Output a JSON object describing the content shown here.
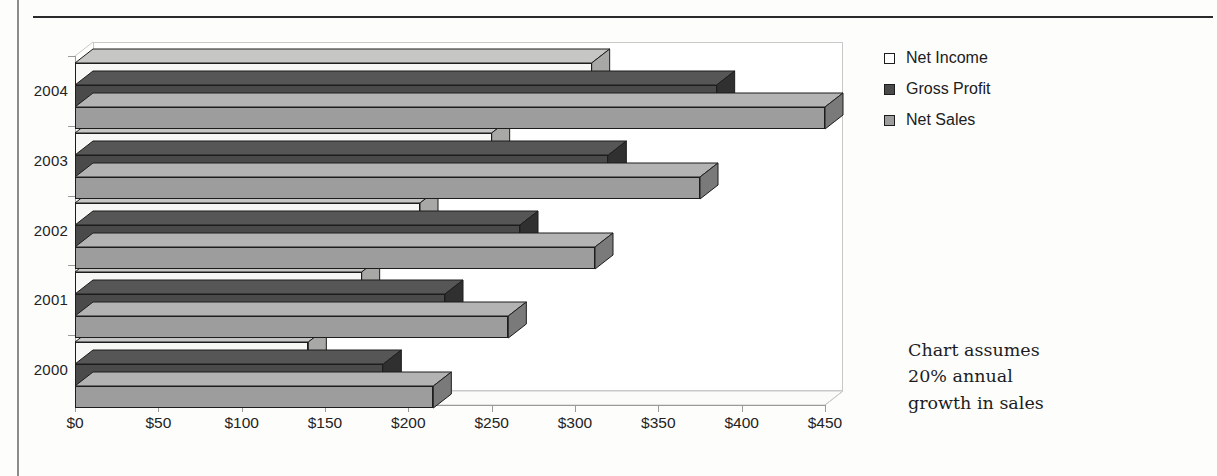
{
  "chart_data": {
    "type": "bar",
    "orientation": "horizontal",
    "style": "3d-clustered-bar",
    "title": "",
    "xlabel": "",
    "ylabel": "",
    "categories": [
      "2000",
      "2001",
      "2002",
      "2003",
      "2004"
    ],
    "series": [
      {
        "name": "Net Income",
        "values": [
          140,
          172,
          207,
          250,
          310
        ]
      },
      {
        "name": "Gross Profit",
        "values": [
          185,
          222,
          267,
          320,
          385
        ]
      },
      {
        "name": "Net Sales",
        "values": [
          215,
          260,
          312,
          375,
          450
        ]
      }
    ],
    "xlim": [
      0,
      450
    ],
    "xticks": [
      0,
      50,
      100,
      150,
      200,
      250,
      300,
      350,
      400,
      450
    ],
    "xtick_labels": [
      "$0",
      "$50",
      "$100",
      "$150",
      "$200",
      "$250",
      "$300",
      "$350",
      "$400",
      "$450"
    ],
    "grid": false,
    "legend_position": "right",
    "annotation": "Chart assumes 20% annual growth in sales",
    "series_colors": {
      "Net Income": "#f7f7f5",
      "Gross Profit": "#4a4a4a",
      "Net Sales": "#9d9d9d"
    }
  },
  "legend": {
    "items": [
      {
        "label": "Net Income",
        "swatch": "net-income"
      },
      {
        "label": "Gross Profit",
        "swatch": "gross-profit"
      },
      {
        "label": "Net Sales",
        "swatch": "net-sales"
      }
    ]
  },
  "annotation": {
    "line1": "Chart assumes",
    "line2": "20% annual",
    "line3": "growth in sales"
  }
}
